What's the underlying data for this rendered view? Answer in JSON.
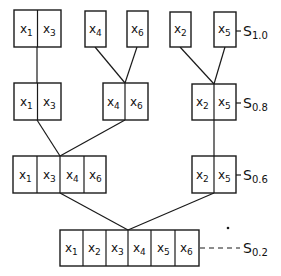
{
  "diagram": {
    "type": "hierarchical-clustering-tree",
    "levels": [
      {
        "label": "S",
        "label_sub": "1.0",
        "connector": "solid",
        "groups": [
          {
            "vars": [
              {
                "base": "x",
                "sub": "1"
              },
              {
                "base": "x",
                "sub": "3"
              }
            ]
          },
          {
            "vars": [
              {
                "base": "x",
                "sub": "4"
              }
            ]
          },
          {
            "vars": [
              {
                "base": "x",
                "sub": "6"
              }
            ]
          },
          {
            "vars": [
              {
                "base": "x",
                "sub": "2"
              }
            ]
          },
          {
            "vars": [
              {
                "base": "x",
                "sub": "5"
              }
            ]
          }
        ]
      },
      {
        "label": "S",
        "label_sub": "0.8",
        "connector": "solid",
        "groups": [
          {
            "vars": [
              {
                "base": "x",
                "sub": "1"
              },
              {
                "base": "x",
                "sub": "3"
              }
            ]
          },
          {
            "vars": [
              {
                "base": "x",
                "sub": "4"
              },
              {
                "base": "x",
                "sub": "6"
              }
            ]
          },
          {
            "vars": [
              {
                "base": "x",
                "sub": "2"
              },
              {
                "base": "x",
                "sub": "5"
              }
            ]
          }
        ]
      },
      {
        "label": "S",
        "label_sub": "0.6",
        "connector": "solid",
        "groups": [
          {
            "vars": [
              {
                "base": "x",
                "sub": "1"
              },
              {
                "base": "x",
                "sub": "3"
              },
              {
                "base": "x",
                "sub": "4"
              },
              {
                "base": "x",
                "sub": "6"
              }
            ]
          },
          {
            "vars": [
              {
                "base": "x",
                "sub": "2"
              },
              {
                "base": "x",
                "sub": "5"
              }
            ]
          }
        ]
      },
      {
        "label": "S",
        "label_sub": "0.2",
        "connector": "dashed",
        "groups": [
          {
            "vars": [
              {
                "base": "x",
                "sub": "1"
              },
              {
                "base": "x",
                "sub": "2"
              },
              {
                "base": "x",
                "sub": "3"
              },
              {
                "base": "x",
                "sub": "4"
              },
              {
                "base": "x",
                "sub": "5"
              },
              {
                "base": "x",
                "sub": "6"
              }
            ]
          }
        ]
      }
    ],
    "colors": {
      "ink": "#1a1a1a",
      "background": "#ffffff"
    }
  }
}
